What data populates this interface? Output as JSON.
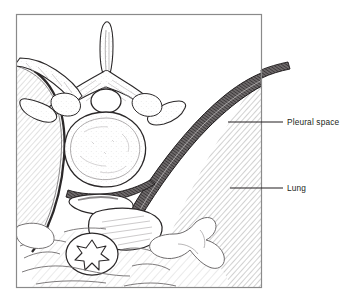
{
  "figure": {
    "kind": "medical-line-illustration",
    "view": "axial cross-section of the thorax at a thoracic vertebral level",
    "frame": {
      "stroke_color": "#8a8a8a",
      "background_color": "#ffffff"
    },
    "ink_color": "#231f20",
    "hatch_color": "#a9a9a9",
    "pleura_fill_color": "#4f4c4d"
  },
  "annotations": [
    {
      "id": "pleural-space",
      "label": "Pleural space",
      "leader": {
        "x1": 228,
        "y1": 122,
        "x2": 283,
        "y2": 122
      },
      "text_x": 287,
      "text_y": 125
    },
    {
      "id": "lung",
      "label": "Lung",
      "leader": {
        "x1": 230,
        "y1": 188,
        "x2": 283,
        "y2": 188
      },
      "text_x": 287,
      "text_y": 191
    }
  ],
  "structures": [
    {
      "id": "spinous-process",
      "name": "Spinous process"
    },
    {
      "id": "vertebral-arch",
      "name": "Vertebral arch / lamina"
    },
    {
      "id": "spinal-canal",
      "name": "Spinal canal"
    },
    {
      "id": "vertebral-body",
      "name": "Vertebral body"
    },
    {
      "id": "transverse-process",
      "name": "Transverse process"
    },
    {
      "id": "rib-left",
      "name": "Rib"
    },
    {
      "id": "lung-right",
      "name": "Lung (hatched)"
    },
    {
      "id": "lung-left",
      "name": "Lung (hatched)"
    },
    {
      "id": "pleural-band",
      "name": "Pleural space (dark band)"
    },
    {
      "id": "vessel-aorta",
      "name": "Descending aorta"
    },
    {
      "id": "esophagus",
      "name": "Esophagus with stellate lumen"
    },
    {
      "id": "mediastinal-tissue",
      "name": "Mediastinal soft tissue"
    }
  ]
}
